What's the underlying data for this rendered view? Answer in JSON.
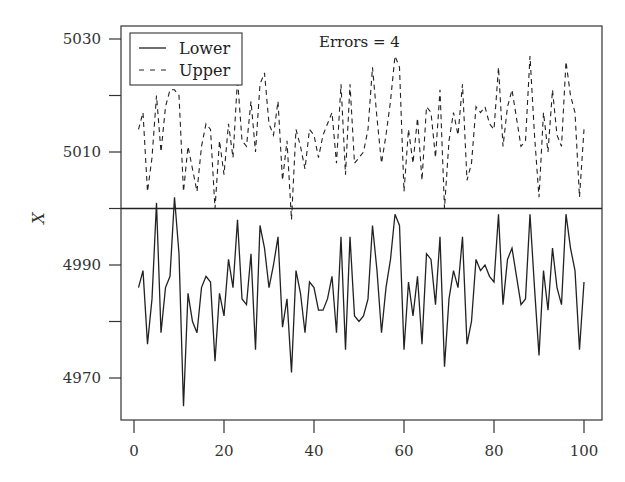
{
  "chart_data": {
    "type": "line",
    "title": "",
    "xlabel": "",
    "ylabel": "X",
    "xlim": [
      -3,
      104
    ],
    "ylim": [
      4962.6,
      5032.4
    ],
    "xticks": [
      0,
      20,
      40,
      60,
      80,
      100
    ],
    "yticks": [
      4970,
      4980,
      4990,
      5000,
      5010,
      5020,
      5030
    ],
    "ytick_labels": {
      "4970": "4970",
      "4990": "4990",
      "5010": "5010",
      "5030": "5030"
    },
    "grid": false,
    "legend_position": "upper left",
    "reference_line": {
      "y": 5000,
      "style": "solid"
    },
    "annotation": "Errors = 4",
    "x": [
      1,
      2,
      3,
      4,
      5,
      6,
      7,
      8,
      9,
      10,
      11,
      12,
      13,
      14,
      15,
      16,
      17,
      18,
      19,
      20,
      21,
      22,
      23,
      24,
      25,
      26,
      27,
      28,
      29,
      30,
      31,
      32,
      33,
      34,
      35,
      36,
      37,
      38,
      39,
      40,
      41,
      42,
      43,
      44,
      45,
      46,
      47,
      48,
      49,
      50,
      51,
      52,
      53,
      54,
      55,
      56,
      57,
      58,
      59,
      60,
      61,
      62,
      63,
      64,
      65,
      66,
      67,
      68,
      69,
      70,
      71,
      72,
      73,
      74,
      75,
      76,
      77,
      78,
      79,
      80,
      81,
      82,
      83,
      84,
      85,
      86,
      87,
      88,
      89,
      90,
      91,
      92,
      93,
      94,
      95,
      96,
      97,
      98,
      99,
      100
    ],
    "series": [
      {
        "name": "Lower",
        "style": "solid",
        "values": [
          4986,
          4989,
          4976,
          4984,
          5001,
          4978,
          4986,
          4988,
          5002,
          4992,
          4965,
          4985,
          4980,
          4978,
          4986,
          4988,
          4987,
          4973,
          4985,
          4981,
          4991,
          4986,
          4998,
          4984,
          4983,
          4992,
          4975,
          4997,
          4993,
          4986,
          4990,
          4995,
          4979,
          4984,
          4971,
          4989,
          4985,
          4978,
          4987,
          4986,
          4982,
          4982,
          4984,
          4988,
          4978,
          4995,
          4975,
          4995,
          4981,
          4980,
          4981,
          4984,
          4997,
          4989,
          4978,
          4986,
          4991,
          4999,
          4997,
          4975,
          4987,
          4981,
          4988,
          4976,
          4992,
          4991,
          4983,
          4995,
          4972,
          4984,
          4989,
          4986,
          4995,
          4976,
          4980,
          4991,
          4989,
          4990,
          4988,
          4987,
          4999,
          4983,
          4991,
          4993,
          4988,
          4983,
          4984,
          4999,
          4986,
          4974,
          4989,
          4982,
          4993,
          4986,
          4983,
          4999,
          4993,
          4989,
          4975,
          4987
        ]
      },
      {
        "name": "Upper",
        "style": "dashed",
        "values": [
          5014,
          5017,
          5003,
          5009,
          5020,
          5010,
          5018,
          5021,
          5021,
          5020,
          5003,
          5011,
          5007,
          5003,
          5011,
          5015,
          5014,
          5000,
          5012,
          5006,
          5015,
          5009,
          5023,
          5012,
          5011,
          5019,
          5010,
          5022,
          5024,
          5015,
          5013,
          5019,
          5005,
          5012,
          4998,
          5014,
          5011,
          5007,
          5014,
          5013,
          5009,
          5013,
          5015,
          5017,
          5008,
          5022,
          5006,
          5022,
          5008,
          5009,
          5010,
          5014,
          5025,
          5016,
          5008,
          5013,
          5019,
          5027,
          5025,
          5003,
          5014,
          5008,
          5016,
          5005,
          5018,
          5017,
          5009,
          5021,
          5000,
          5012,
          5017,
          5013,
          5022,
          5005,
          5008,
          5018,
          5017,
          5018,
          5015,
          5014,
          5025,
          5011,
          5018,
          5021,
          5016,
          5011,
          5012,
          5027,
          5013,
          5002,
          5017,
          5010,
          5021,
          5013,
          5011,
          5026,
          5020,
          5017,
          5002,
          5014
        ]
      }
    ]
  },
  "legend": {
    "lower_label": "Lower",
    "upper_label": "Upper"
  },
  "annotation": {
    "text": "Errors = 4"
  },
  "axes": {
    "ylabel": "X",
    "x_tick_labels": [
      "0",
      "20",
      "40",
      "60",
      "80",
      "100"
    ],
    "y_tick_labels": [
      "4970",
      "4990",
      "5010",
      "5030"
    ]
  }
}
